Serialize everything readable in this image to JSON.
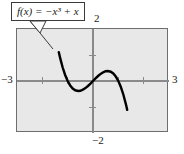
{
  "figure": {
    "background_color": "#ffffff",
    "plot_background_color": "#e8e8e8",
    "frame_color": "#6e6e6e",
    "axis_color": "#8a8a8a",
    "curve_color": "#000000"
  },
  "callout": {
    "formula": "f(x) = −x³ + x",
    "border_color": "#3a3a3a",
    "fill_color": "#ffffff"
  },
  "axis_labels": {
    "x_min": "−3",
    "x_max": "3",
    "y_max": "2",
    "y_min": "−2"
  },
  "chart_data": {
    "type": "line",
    "title": "f(x) = −x³ + x",
    "xlabel": "",
    "ylabel": "",
    "xlim": [
      -3,
      3
    ],
    "ylim": [
      -2,
      2
    ],
    "grid": false,
    "legend": "none",
    "annotations": [
      {
        "text": "f(x) = −x³ + x",
        "kind": "callout-box",
        "points_to_x": -1.45,
        "points_to_y": 1.55
      }
    ],
    "xticks": [
      -2,
      -1,
      1,
      2
    ],
    "yticks": [
      -1,
      1
    ],
    "xtick_labels": [
      "",
      "",
      "",
      ""
    ],
    "ytick_labels": [
      "",
      ""
    ],
    "series": [
      {
        "name": "f(x) = -x^3 + x",
        "expression": "-x**3 + x",
        "color": "#000000",
        "x": [
          -1.35,
          -1.3,
          -1.2,
          -1.1,
          -1.0,
          -0.9,
          -0.8,
          -0.7,
          -0.58,
          -0.5,
          -0.4,
          -0.3,
          -0.2,
          -0.1,
          0.0,
          0.1,
          0.2,
          0.3,
          0.4,
          0.5,
          0.58,
          0.7,
          0.8,
          0.9,
          1.0,
          1.1,
          1.2,
          1.3,
          1.35
        ],
        "y": [
          1.11,
          0.897,
          0.528,
          0.231,
          0.0,
          -0.171,
          -0.288,
          -0.357,
          -0.385,
          -0.375,
          -0.336,
          -0.273,
          -0.192,
          -0.099,
          0.0,
          0.099,
          0.192,
          0.273,
          0.336,
          0.375,
          0.385,
          0.357,
          0.288,
          0.171,
          0.0,
          -0.231,
          -0.528,
          -0.897,
          -1.11
        ],
        "local_min": {
          "x": -0.577,
          "y": -0.385
        },
        "local_max": {
          "x": 0.577,
          "y": 0.385
        },
        "roots": [
          -1,
          0,
          1
        ]
      }
    ]
  }
}
